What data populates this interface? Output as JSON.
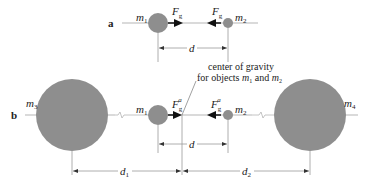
{
  "colors": {
    "mass_fill": "#8e8e8e",
    "line": "#b5b5b5",
    "dim_line": "#9a9a9a",
    "arrow": "#111111",
    "text": "#222222"
  },
  "panel_a": {
    "label": "a",
    "masses": [
      {
        "name": "m",
        "sub": "1"
      },
      {
        "name": "m",
        "sub": "2"
      }
    ],
    "forces": [
      {
        "name": "F",
        "sub": "g"
      },
      {
        "name": "F",
        "sub": "g"
      }
    ],
    "distance": "d"
  },
  "panel_b": {
    "label": "b",
    "masses": [
      {
        "name": "m",
        "sub": "1"
      },
      {
        "name": "m",
        "sub": "2"
      },
      {
        "name": "m",
        "sub": "3"
      },
      {
        "name": "m",
        "sub": "4"
      }
    ],
    "forces": [
      {
        "name": "F",
        "sub": "g",
        "sup": "a"
      },
      {
        "name": "F",
        "sub": "g",
        "sup": "a"
      }
    ],
    "annotation": {
      "line1": "center of gravity",
      "line2_prefix": "for objects ",
      "m": "m",
      "sub1": "1",
      "and": " and ",
      "sub2": "2"
    },
    "distance": "d",
    "distance_1": {
      "name": "d",
      "sub": "1"
    },
    "distance_2": {
      "name": "d",
      "sub": "2"
    }
  }
}
